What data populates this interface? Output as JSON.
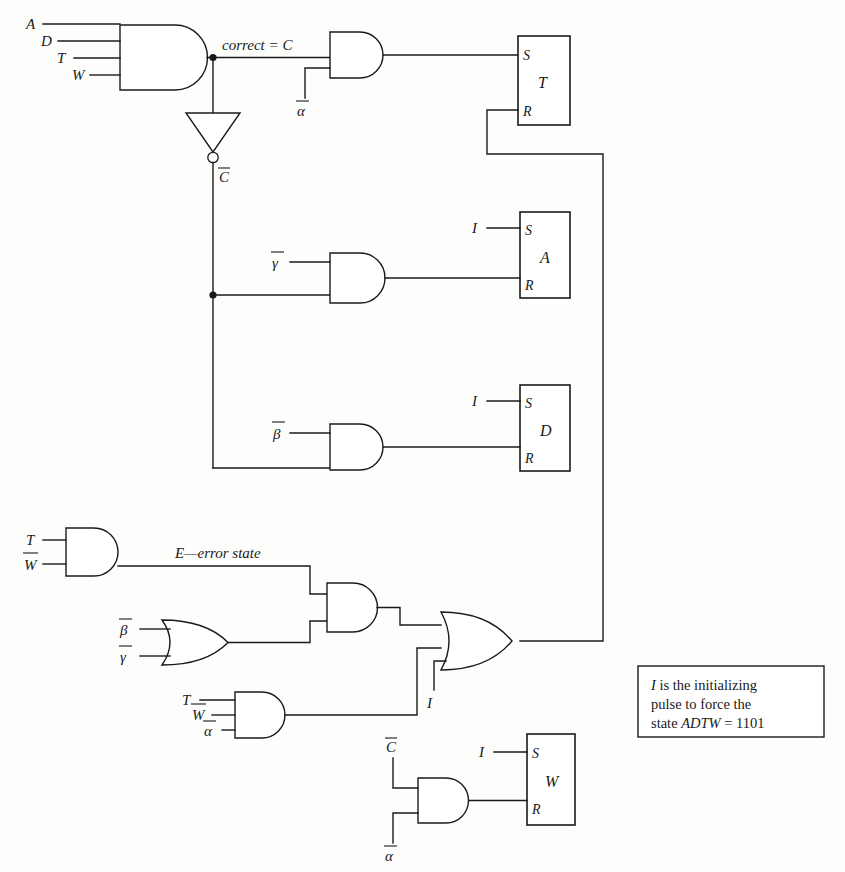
{
  "diagram": {
    "ink_color": "#1a1a1a",
    "background_color": "#fdfdfb"
  },
  "labels": {
    "input_a": "A",
    "input_d": "D",
    "input_t": "T",
    "input_w": "W",
    "correct_eq_c": "correct = C",
    "c_bar": "C",
    "alpha_bar_top": "α",
    "gamma_bar": "γ",
    "beta_bar": "β",
    "init_i_a": "I",
    "init_i_d": "I",
    "init_i_or": "I",
    "init_i_w": "I",
    "err_t": "T",
    "err_wbar": "W",
    "err_state": "E—error state",
    "or_beta_bar": "β",
    "or_gamma_bar": "γ",
    "and3_t": "T",
    "and3_wbar": "W",
    "and3_alphabar": "α",
    "w_cbar": "C",
    "w_alphabar": "α"
  },
  "flipflops": [
    {
      "name": "T",
      "set_pin": "S",
      "reset_pin": "R"
    },
    {
      "name": "A",
      "set_pin": "S",
      "reset_pin": "R"
    },
    {
      "name": "D",
      "set_pin": "S",
      "reset_pin": "R"
    },
    {
      "name": "W",
      "set_pin": "S",
      "reset_pin": "R"
    }
  ],
  "note": {
    "line1": "I is the initializing",
    "line1_italic": "I",
    "line1_rest": " is the initializing",
    "line2": "pulse to force the",
    "line3_pre": "state ",
    "line3_italic": "ADTW",
    "line3_post": " = 1101",
    "full_text": "I is the initializing pulse to force the state ADTW = 1101"
  },
  "gates": [
    {
      "id": "and-main-adtw",
      "type": "AND",
      "inputs": [
        "A",
        "D",
        "T",
        "W"
      ],
      "output": "C"
    },
    {
      "id": "inverter-c",
      "type": "NOT",
      "inputs": [
        "C"
      ],
      "output": "C̄"
    },
    {
      "id": "and-t-set",
      "type": "AND",
      "inputs": [
        "C",
        "ᾱ"
      ],
      "output": "T.S"
    },
    {
      "id": "and-a-reset",
      "type": "AND",
      "inputs": [
        "γ̄",
        "C̄"
      ],
      "output": "A.R"
    },
    {
      "id": "and-d-reset",
      "type": "AND",
      "inputs": [
        "β̄",
        "C̄"
      ],
      "output": "D.R"
    },
    {
      "id": "and-error-state",
      "type": "AND",
      "inputs": [
        "T",
        "W̄"
      ],
      "output": "E"
    },
    {
      "id": "or-beta-gamma",
      "type": "OR",
      "inputs": [
        "β̄",
        "γ̄"
      ],
      "output": ""
    },
    {
      "id": "and-error-combine",
      "type": "AND",
      "inputs": [
        "E",
        "or-beta-gamma"
      ],
      "output": ""
    },
    {
      "id": "and-t-w-alpha",
      "type": "AND",
      "inputs": [
        "T",
        "W̄",
        "ᾱ"
      ],
      "output": ""
    },
    {
      "id": "or-t-reset",
      "type": "OR",
      "inputs": [
        "and-error-combine",
        "and-t-w-alpha",
        "I"
      ],
      "output": "T.R"
    },
    {
      "id": "and-w-reset",
      "type": "AND",
      "inputs": [
        "C̄",
        "ᾱ"
      ],
      "output": "W.R"
    }
  ]
}
